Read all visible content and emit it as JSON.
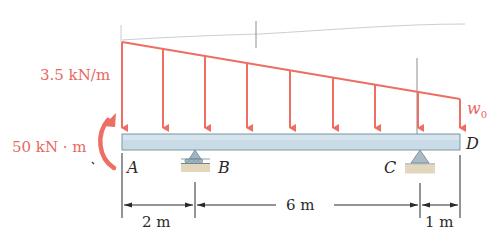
{
  "diagram": {
    "type": "beam-loading",
    "colors": {
      "load": "#ef6e63",
      "beam_fill": "#c9dbe6",
      "beam_stroke": "#7f97a6",
      "support": "#9fb4bf",
      "ground": "#e2d6bd",
      "dimension": "#2a2a2a"
    },
    "loads": {
      "distributed_start_label": "3.5 kN/m",
      "distributed_end_label": "w",
      "distributed_end_subscript": "0",
      "moment_label": "50 kN · m"
    },
    "points": {
      "A": "A",
      "B": "B",
      "C": "C",
      "D": "D"
    },
    "dimensions": {
      "AB": "2 m",
      "BC": "6 m",
      "CD": "1 m"
    },
    "supports": [
      {
        "at": "B",
        "kind": "roller"
      },
      {
        "at": "C",
        "kind": "pin"
      }
    ]
  }
}
